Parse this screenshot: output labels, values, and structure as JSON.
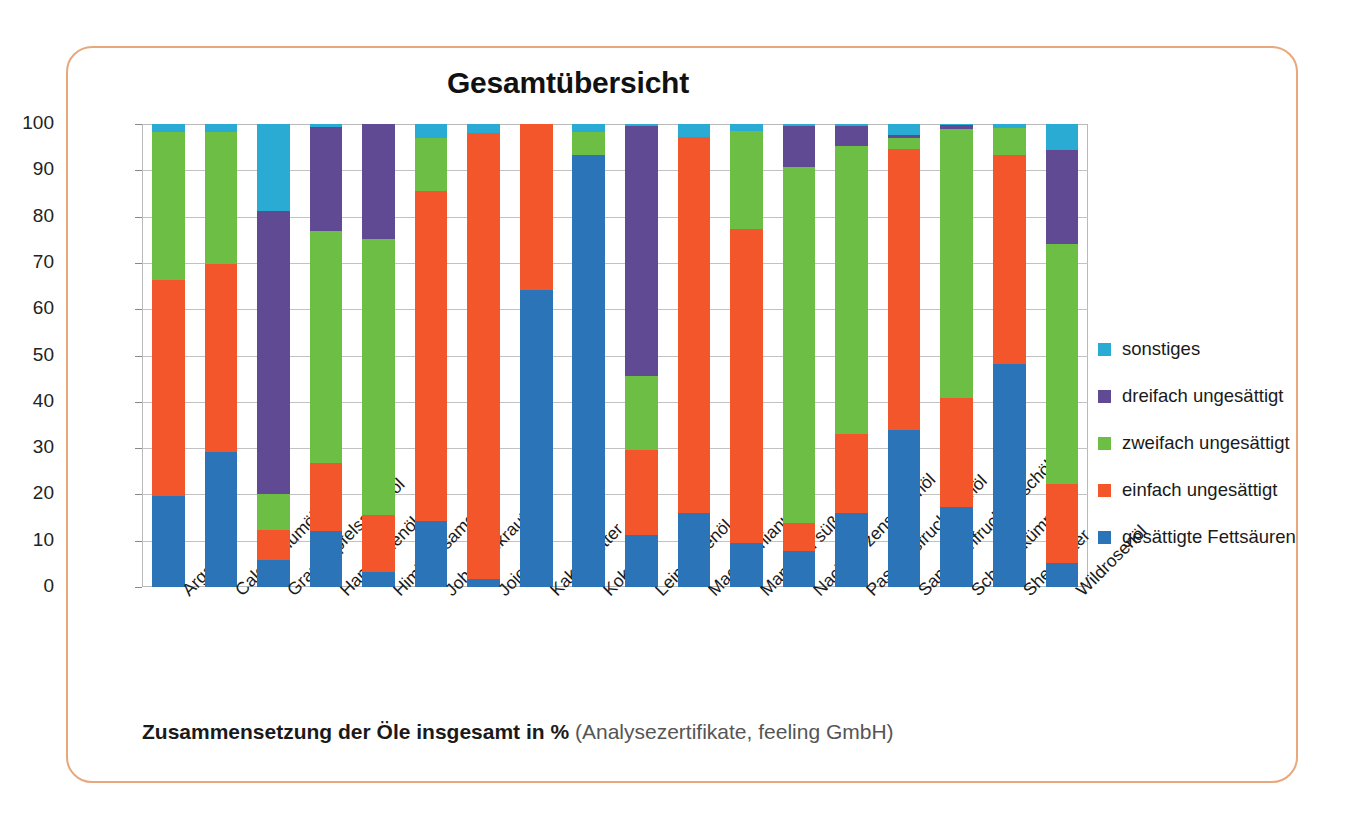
{
  "frame": {
    "border_color": "#e8a87c"
  },
  "header": {
    "title": "Gesamtübersicht"
  },
  "caption": {
    "main": "Zusammensetzung der Öle insgesamt in %",
    "source": "(Analysezertifikate, feeling GmbH)"
  },
  "legend": {
    "position": "right",
    "items": [
      {
        "label": "sonstiges",
        "color": "#29abd4",
        "key": "sonstiges"
      },
      {
        "label": "dreifach ungesättigt",
        "color": "#5f4a93",
        "key": "dreifach"
      },
      {
        "label": "zweifach ungesättigt",
        "color": "#6cbe45",
        "key": "zweifach"
      },
      {
        "label": "einfach ungesättigt",
        "color": "#f4562c",
        "key": "einfach"
      },
      {
        "label": "gesättigte Fettsäuren",
        "color": "#2b74b8",
        "key": "gesaettigt"
      }
    ]
  },
  "chart_data": {
    "type": "bar",
    "stacked": true,
    "title": "Gesamtübersicht",
    "xlabel": "",
    "ylabel": "",
    "ylim": [
      0,
      100
    ],
    "yticks": [
      0,
      10,
      20,
      30,
      40,
      50,
      60,
      70,
      80,
      90,
      100
    ],
    "ytick_labels": [
      "0",
      "10",
      "20",
      "30",
      "40",
      "50",
      "60",
      "70",
      "80",
      "90",
      "100"
    ],
    "grid": true,
    "legend_position": "right",
    "categories": [
      "Arganöl",
      "Calophyllumöl",
      "Granatapfelsamenöl",
      "Hanfsamenöl",
      "Himbeersamenöl",
      "Johanniskrautöl",
      "Jojoba",
      "Kakaobutter",
      "Kokosöl",
      "Leinsamenöl",
      "Macadamianussöl",
      "Mandelöl süß",
      "Nachtkerzensamenöl",
      "Passionsfruchtkernöl",
      "Sanddornfruchtfleischöl",
      "Schwarzkümmelöl",
      "Sheabutter",
      "Wildrosenöl"
    ],
    "series": [
      {
        "name": "gesättigte Fettsäuren",
        "color": "#2b74b8",
        "values": [
          19.7,
          29.2,
          5.8,
          12.0,
          3.2,
          14.2,
          1.8,
          64.1,
          93.4,
          11.2,
          15.9,
          9.4,
          7.8,
          15.9,
          34.0,
          17.3,
          48.2,
          5.2
        ]
      },
      {
        "name": "einfach ungesättigt",
        "color": "#f4562c",
        "values": [
          46.6,
          40.6,
          6.6,
          14.8,
          12.3,
          71.4,
          96.2,
          35.9,
          0.0,
          18.4,
          81.4,
          68.0,
          6.0,
          17.2,
          60.5,
          23.6,
          45.1,
          17.0
        ]
      },
      {
        "name": "zweifach ungesättigt",
        "color": "#6cbe45",
        "values": [
          32.0,
          28.4,
          7.8,
          50.2,
          59.6,
          11.4,
          0.0,
          0.0,
          4.8,
          16.0,
          0.0,
          21.0,
          76.9,
          62.2,
          2.5,
          58.0,
          5.9,
          51.9
        ]
      },
      {
        "name": "dreifach ungesättigt",
        "color": "#5f4a93",
        "values": [
          0.0,
          0.0,
          61.0,
          22.4,
          24.9,
          0.0,
          0.0,
          0.0,
          0.0,
          54.0,
          0.0,
          0.0,
          8.8,
          4.2,
          0.6,
          0.8,
          0.0,
          20.2
        ]
      },
      {
        "name": "sonstiges",
        "color": "#29abd4",
        "values": [
          1.7,
          1.8,
          18.8,
          0.6,
          0.0,
          3.0,
          2.0,
          0.0,
          1.8,
          0.4,
          2.7,
          1.6,
          0.5,
          0.5,
          2.4,
          0.3,
          0.8,
          5.7
        ]
      }
    ]
  }
}
